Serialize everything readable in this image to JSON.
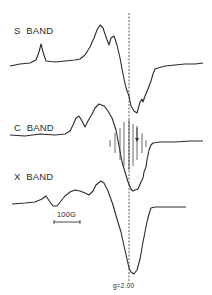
{
  "chart_data": {
    "type": "line",
    "title": "",
    "xlabel": "",
    "ylabel": "",
    "grid": false,
    "legend": "none",
    "annotations": {
      "g_marker": "g=2.00",
      "scale_bar": "100G",
      "stick_marks_band": "C BAND",
      "arrow_band": "C BAND"
    },
    "series": [
      {
        "name": "S BAND",
        "label_pos": [
          14,
          25
        ],
        "points": [
          [
            10,
            66
          ],
          [
            20,
            64
          ],
          [
            30,
            63
          ],
          [
            36,
            60
          ],
          [
            39,
            52
          ],
          [
            41,
            44
          ],
          [
            43,
            52
          ],
          [
            46,
            61
          ],
          [
            55,
            62
          ],
          [
            65,
            61
          ],
          [
            75,
            60
          ],
          [
            80,
            59
          ],
          [
            85,
            55
          ],
          [
            90,
            47
          ],
          [
            94,
            38
          ],
          [
            97,
            30
          ],
          [
            100,
            25
          ],
          [
            103,
            28
          ],
          [
            106,
            37
          ],
          [
            109,
            45
          ],
          [
            111,
            38
          ],
          [
            114,
            36
          ],
          [
            117,
            45
          ],
          [
            120,
            58
          ],
          [
            123,
            74
          ],
          [
            126,
            88
          ],
          [
            129,
            96
          ],
          [
            131,
            106
          ],
          [
            134,
            111
          ],
          [
            137,
            113
          ],
          [
            140,
            102
          ],
          [
            142,
            99
          ],
          [
            143,
            102
          ],
          [
            145,
            96
          ],
          [
            148,
            89
          ],
          [
            151,
            81
          ],
          [
            153,
            74
          ],
          [
            155,
            69
          ],
          [
            158,
            68
          ],
          [
            165,
            66
          ],
          [
            175,
            65
          ],
          [
            185,
            64
          ],
          [
            195,
            64
          ],
          [
            203,
            63
          ]
        ]
      },
      {
        "name": "C BAND",
        "label_pos": [
          14,
          122
        ],
        "points": [
          [
            10,
            135
          ],
          [
            25,
            136
          ],
          [
            40,
            134
          ],
          [
            55,
            135
          ],
          [
            65,
            134
          ],
          [
            70,
            131
          ],
          [
            73,
            125
          ],
          [
            76,
            118
          ],
          [
            79,
            116
          ],
          [
            82,
            121
          ],
          [
            85,
            127
          ],
          [
            88,
            121
          ],
          [
            92,
            114
          ],
          [
            95,
            108
          ],
          [
            99,
            104
          ],
          [
            104,
            106
          ],
          [
            108,
            111
          ],
          [
            112,
            118
          ],
          [
            116,
            130
          ],
          [
            119,
            146
          ],
          [
            122,
            162
          ],
          [
            125,
            172
          ],
          [
            128,
            182
          ],
          [
            131,
            189
          ],
          [
            133,
            191
          ],
          [
            135,
            190
          ],
          [
            138,
            189
          ],
          [
            141,
            182
          ],
          [
            143,
            178
          ],
          [
            144,
            172
          ],
          [
            146,
            167
          ],
          [
            147,
            160
          ],
          [
            149,
            150
          ],
          [
            151,
            145
          ],
          [
            153,
            143
          ],
          [
            160,
            142
          ],
          [
            175,
            142
          ],
          [
            190,
            141
          ],
          [
            203,
            141
          ]
        ]
      },
      {
        "name": "X BAND",
        "label_pos": [
          14,
          171
        ],
        "points": [
          [
            12,
            204
          ],
          [
            25,
            203
          ],
          [
            35,
            202
          ],
          [
            42,
            199
          ],
          [
            46,
            196
          ],
          [
            50,
            202
          ],
          [
            53,
            206
          ],
          [
            57,
            206
          ],
          [
            61,
            201
          ],
          [
            65,
            196
          ],
          [
            70,
            192
          ],
          [
            75,
            190
          ],
          [
            80,
            191
          ],
          [
            85,
            193
          ],
          [
            89,
            195
          ],
          [
            93,
            191
          ],
          [
            96,
            185
          ],
          [
            101,
            181
          ],
          [
            104,
            183
          ],
          [
            108,
            191
          ],
          [
            113,
            205
          ],
          [
            117,
            219
          ],
          [
            121,
            232
          ],
          [
            124,
            246
          ],
          [
            127,
            259
          ],
          [
            129,
            268
          ],
          [
            131,
            272
          ],
          [
            134,
            274
          ],
          [
            137,
            270
          ],
          [
            140,
            259
          ],
          [
            143,
            242
          ],
          [
            147,
            222
          ],
          [
            149,
            214
          ],
          [
            151,
            208
          ],
          [
            155,
            207
          ],
          [
            168,
            207
          ],
          [
            186,
            207
          ]
        ]
      }
    ],
    "stick_marks": {
      "band": "C BAND",
      "x": [
        110,
        115,
        120,
        124,
        129,
        133,
        137,
        142,
        146
      ],
      "tops": [
        140,
        133,
        128,
        122,
        120,
        124,
        128,
        133,
        140
      ],
      "bottoms": [
        147,
        153,
        160,
        166,
        170,
        166,
        160,
        153,
        147
      ]
    },
    "arrow": {
      "x": 137,
      "y1": 126,
      "y2": 142
    },
    "g_line": {
      "x": 129,
      "y_top": 13,
      "y_bottom": 283,
      "label": "g=2.00",
      "label_pos": [
        113,
        283
      ]
    },
    "scale_bar": {
      "x1": 54,
      "x2": 80,
      "y": 222,
      "label": "100G",
      "label_pos": [
        57,
        210
      ]
    }
  },
  "labels": {
    "s_band": "S  BAND",
    "c_band": "C  BAND",
    "x_band": "X  BAND",
    "scale": "100G",
    "g_value": "g=2.00"
  }
}
